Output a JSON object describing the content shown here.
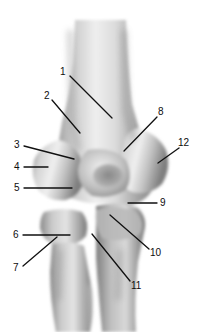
{
  "figure": {
    "title": "ANTERIOR",
    "view": "anterior",
    "background_color": "#ffffff",
    "title_color": "#141414",
    "label_color": "#0d0d0d",
    "leader_color": "#111111",
    "bone_tone_light": "#e8e8e8",
    "bone_tone_mid": "#b4b4b4",
    "bone_tone_dark": "#6e6e6e",
    "bone_tone_shadow": "#4a4a4a"
  },
  "labels": [
    {
      "id": "1",
      "text": "1",
      "x": 60,
      "y": 67,
      "line": {
        "x1": 70,
        "y1": 76,
        "x2": 112,
        "y2": 118
      }
    },
    {
      "id": "2",
      "text": "2",
      "x": 44,
      "y": 91,
      "line": {
        "x1": 52,
        "y1": 100,
        "x2": 80,
        "y2": 133
      }
    },
    {
      "id": "3",
      "text": "3",
      "x": 14,
      "y": 140,
      "line": {
        "x1": 24,
        "y1": 146,
        "x2": 74,
        "y2": 159
      }
    },
    {
      "id": "4",
      "text": "4",
      "x": 14,
      "y": 162,
      "line": {
        "x1": 24,
        "y1": 167,
        "x2": 48,
        "y2": 167
      }
    },
    {
      "id": "5",
      "text": "5",
      "x": 14,
      "y": 183,
      "line": {
        "x1": 24,
        "y1": 188,
        "x2": 72,
        "y2": 188
      }
    },
    {
      "id": "6",
      "text": "6",
      "x": 13,
      "y": 230,
      "line": {
        "x1": 23,
        "y1": 235,
        "x2": 70,
        "y2": 235
      }
    },
    {
      "id": "7",
      "text": "7",
      "x": 13,
      "y": 263,
      "line": {
        "x1": 23,
        "y1": 266,
        "x2": 57,
        "y2": 237
      }
    },
    {
      "id": "8",
      "text": "8",
      "x": 158,
      "y": 107,
      "line": {
        "x1": 157,
        "y1": 117,
        "x2": 124,
        "y2": 151
      }
    },
    {
      "id": "9",
      "text": "9",
      "x": 160,
      "y": 198,
      "line": {
        "x1": 157,
        "y1": 203,
        "x2": 128,
        "y2": 203
      }
    },
    {
      "id": "10",
      "text": "10",
      "x": 150,
      "y": 248,
      "line": {
        "x1": 149,
        "y1": 249,
        "x2": 110,
        "y2": 215
      }
    },
    {
      "id": "11",
      "text": "11",
      "x": 131,
      "y": 281,
      "line": {
        "x1": 130,
        "y1": 281,
        "x2": 92,
        "y2": 234
      }
    },
    {
      "id": "12",
      "text": "12",
      "x": 178,
      "y": 138,
      "line": {
        "x1": 179,
        "y1": 148,
        "x2": 158,
        "y2": 163
      }
    }
  ]
}
